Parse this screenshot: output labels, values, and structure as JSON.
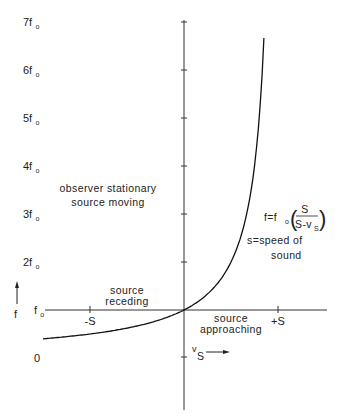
{
  "chart_data": {
    "type": "line",
    "title": "",
    "xlabel": "v_S",
    "ylabel": "f",
    "grid": false,
    "legend": null,
    "x_ticks": [
      {
        "label": "-S",
        "value": -1
      },
      {
        "label": "+S",
        "value": 1
      }
    ],
    "y_ticks": [
      {
        "label": "0",
        "value": 0
      },
      {
        "label": "f",
        "sub": "o",
        "value": 1
      },
      {
        "label": "2f",
        "sub": "o",
        "value": 2
      },
      {
        "label": "3f",
        "sub": "o",
        "value": 3
      },
      {
        "label": "4f",
        "sub": "o",
        "value": 4
      },
      {
        "label": "5f",
        "sub": "o",
        "value": 5
      },
      {
        "label": "6f",
        "sub": "o",
        "value": 6
      },
      {
        "label": "7f",
        "sub": "o",
        "value": 7
      }
    ],
    "xlim": [
      -1.5,
      1.5
    ],
    "ylim": [
      0,
      7
    ],
    "series": [
      {
        "name": "f = f0 (S / (S - vS))",
        "x_units": "S",
        "y_units": "f0",
        "x": [
          -1.5,
          -1.0,
          -0.5,
          0.0,
          0.25,
          0.5,
          0.6,
          0.7,
          0.75,
          0.8,
          0.83,
          0.85
        ],
        "y": [
          0.4,
          0.5,
          0.667,
          1.0,
          1.333,
          2.0,
          2.5,
          3.333,
          4.0,
          5.0,
          5.88,
          6.67
        ]
      }
    ],
    "annotations": {
      "region_title_line1": "observer stationary",
      "region_title_line2": "source moving",
      "formula_lhs": "f=f",
      "formula_sub": "o",
      "formula_num": "S",
      "formula_den": "S-v",
      "formula_den_sub": "S",
      "speed_line1": "s=speed  of",
      "speed_line2": "sound",
      "receding_line1": "source",
      "receding_line2": "receding",
      "approaching_line1": "source",
      "approaching_line2": "approaching",
      "x_axis_label": "v",
      "x_axis_label_sub": "S",
      "y_axis_label": "f"
    }
  }
}
